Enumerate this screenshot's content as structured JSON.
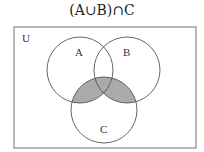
{
  "title": "(A∪B)∩C",
  "universe": {
    "label": "U",
    "x": 14,
    "y": 27,
    "width": 182,
    "height": 121
  },
  "sets": [
    {
      "label": "A",
      "cx": 80,
      "cy": 70,
      "r": 33,
      "label_x": 78,
      "label_y": 52
    },
    {
      "label": "B",
      "cx": 127,
      "cy": 70,
      "r": 33,
      "label_x": 127,
      "label_y": 52
    },
    {
      "label": "C",
      "cx": 104,
      "cy": 110,
      "r": 33,
      "label_x": 104,
      "label_y": 132
    }
  ],
  "shaded_region": "(A∪B)∩C",
  "colors": {
    "stroke": "#555555",
    "fill": "#aaaaaa",
    "box": "#888888"
  }
}
